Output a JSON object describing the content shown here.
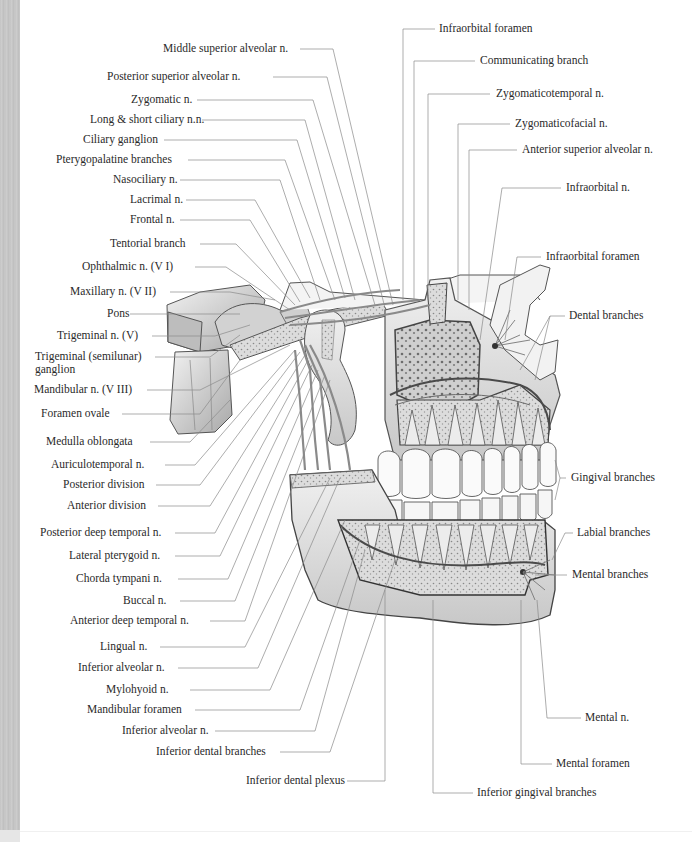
{
  "figure": {
    "colors": {
      "background": "#ffffff",
      "label_text": "#2a2a2a",
      "leader_line": "#7a7a7a",
      "bone_fill": "#e4e4e4",
      "bone_dark": "#6a6a6a",
      "teeth_fill": "#fafafa",
      "left_strip": "#c6c6c6"
    }
  },
  "labels_left": [
    {
      "id": "middle-superior-alveolar",
      "text": "Middle superior alveolar n.",
      "x": 163,
      "y": 42
    },
    {
      "id": "posterior-superior-alveolar",
      "text": "Posterior superior alveolar n.",
      "x": 107,
      "y": 70
    },
    {
      "id": "zygomatic",
      "text": "Zygomatic n.",
      "x": 131,
      "y": 93
    },
    {
      "id": "long-short-ciliary",
      "text": "Long & short ciliary n.n.",
      "x": 90,
      "y": 113
    },
    {
      "id": "ciliary-ganglion",
      "text": "Ciliary ganglion",
      "x": 83,
      "y": 133
    },
    {
      "id": "pterygopalatine-branches",
      "text": "Pterygopalatine branches",
      "x": 56,
      "y": 153
    },
    {
      "id": "nasociliary",
      "text": "Nasociliary n.",
      "x": 113,
      "y": 173
    },
    {
      "id": "lacrimal",
      "text": "Lacrimal n.",
      "x": 130,
      "y": 193
    },
    {
      "id": "frontal",
      "text": "Frontal n.",
      "x": 130,
      "y": 213
    },
    {
      "id": "tentorial-branch",
      "text": "Tentorial branch",
      "x": 110,
      "y": 237
    },
    {
      "id": "ophthalmic",
      "text": "Ophthalmic n. (V I)",
      "x": 82,
      "y": 260
    },
    {
      "id": "maxillary",
      "text": "Maxillary n. (V II)",
      "x": 70,
      "y": 285
    },
    {
      "id": "pons",
      "text": "Pons",
      "x": 107,
      "y": 307
    },
    {
      "id": "trigeminal-n",
      "text": "Trigeminal n. (V)",
      "x": 57,
      "y": 329
    },
    {
      "id": "trigeminal-ganglion",
      "text": "Trigeminal (semilunar)",
      "text2": "ganglion",
      "x": 35,
      "y": 350
    },
    {
      "id": "mandibular",
      "text": "Mandibular n. (V III)",
      "x": 34,
      "y": 383
    },
    {
      "id": "foramen-ovale",
      "text": "Foramen ovale",
      "x": 41,
      "y": 407
    },
    {
      "id": "medulla-oblongata",
      "text": "Medulla oblongata",
      "x": 46,
      "y": 435
    },
    {
      "id": "auriculotemporal",
      "text": "Auriculotemporal n.",
      "x": 51,
      "y": 458
    },
    {
      "id": "posterior-division",
      "text": "Posterior division",
      "x": 63,
      "y": 478
    },
    {
      "id": "anterior-division",
      "text": "Anterior division",
      "x": 67,
      "y": 499
    },
    {
      "id": "posterior-deep-temporal",
      "text": "Posterior deep temporal n.",
      "x": 40,
      "y": 526
    },
    {
      "id": "lateral-pterygoid",
      "text": "Lateral pterygoid n.",
      "x": 69,
      "y": 549
    },
    {
      "id": "chorda-tympani",
      "text": "Chorda tympani n.",
      "x": 76,
      "y": 572
    },
    {
      "id": "buccal",
      "text": "Buccal n.",
      "x": 123,
      "y": 594
    },
    {
      "id": "anterior-deep-temporal",
      "text": "Anterior deep temporal n.",
      "x": 70,
      "y": 614
    },
    {
      "id": "lingual",
      "text": "Lingual n.",
      "x": 100,
      "y": 640
    },
    {
      "id": "inferior-alveolar-1",
      "text": "Inferior alveolar n.",
      "x": 78,
      "y": 661
    },
    {
      "id": "mylohyoid",
      "text": "Mylohyoid n.",
      "x": 106,
      "y": 683
    },
    {
      "id": "mandibular-foramen",
      "text": "Mandibular foramen",
      "x": 87,
      "y": 703
    },
    {
      "id": "inferior-alveolar-2",
      "text": "Inferior alveolar n.",
      "x": 122,
      "y": 724
    },
    {
      "id": "inferior-dental-branches",
      "text": "Inferior dental branches",
      "x": 156,
      "y": 745
    },
    {
      "id": "inferior-dental-plexus",
      "text": "Inferior dental plexus",
      "x": 246,
      "y": 774
    }
  ],
  "labels_right": [
    {
      "id": "infraorbital-foramen-1",
      "text": "Infraorbital foramen",
      "x": 439,
      "y": 22
    },
    {
      "id": "communicating-branch",
      "text": "Communicating branch",
      "x": 480,
      "y": 54
    },
    {
      "id": "zygomaticotemporal",
      "text": "Zygomaticotemporal n.",
      "x": 496,
      "y": 87
    },
    {
      "id": "zygomaticofacial",
      "text": "Zygomaticofacial n.",
      "x": 515,
      "y": 117
    },
    {
      "id": "anterior-superior-alveolar",
      "text": "Anterior superior alveolar n.",
      "x": 522,
      "y": 143
    },
    {
      "id": "infraorbital-n",
      "text": "Infraorbital n.",
      "x": 566,
      "y": 181
    },
    {
      "id": "infraorbital-foramen-2",
      "text": "Infraorbital foramen",
      "x": 546,
      "y": 250
    },
    {
      "id": "dental-branches",
      "text": "Dental branches",
      "x": 569,
      "y": 309
    },
    {
      "id": "gingival-branches",
      "text": "Gingival branches",
      "x": 571,
      "y": 471
    },
    {
      "id": "labial-branches",
      "text": "Labial branches",
      "x": 577,
      "y": 526
    },
    {
      "id": "mental-branches",
      "text": "Mental branches",
      "x": 572,
      "y": 568
    },
    {
      "id": "mental-n",
      "text": "Mental n.",
      "x": 585,
      "y": 711
    },
    {
      "id": "mental-foramen",
      "text": "Mental foramen",
      "x": 556,
      "y": 757
    },
    {
      "id": "inferior-gingival-branches",
      "text": "Inferior gingival branches",
      "x": 477,
      "y": 786
    }
  ]
}
